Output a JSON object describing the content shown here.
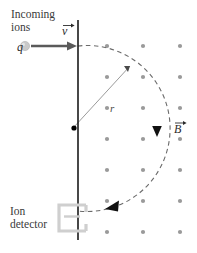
{
  "figure": {
    "background_color": "#ffffff"
  },
  "labels": {
    "incoming_ions": "Incoming\nions",
    "ion_detector": "Ion\ndetector",
    "charge": "q",
    "velocity": "v",
    "magnetic_field": "B",
    "radius": "r"
  },
  "colors": {
    "plate_line": "#1a1a1a",
    "ion_path_dashed": "#6b6b6b",
    "field_dot": "#9a9a9a",
    "detector_outline": "#cfcfcf",
    "velocity_arrow": "#5a5a5a",
    "charge_sphere": "#c8c8c8",
    "radius_line": "#9a9a9a",
    "center_dot": "#000000",
    "arrowhead": "#111111",
    "text": "#3a3a3a"
  },
  "geometry": {
    "plate_line": {
      "x": 78,
      "y_top": 20,
      "y_bottom": 240
    },
    "circle_center": {
      "x": 73,
      "y": 128
    },
    "circle_radius": 83,
    "entry_point": {
      "x": 78,
      "y": 46
    },
    "exit_point": {
      "x": 78,
      "y": 211
    },
    "radius_endpoint": {
      "x": 131,
      "y": 65
    },
    "velocity_arrow": {
      "x_start": 31,
      "x_end": 76,
      "y": 46
    },
    "charge_sphere": {
      "x": 24,
      "y": 46,
      "r": 4.5
    },
    "detector_rect": {
      "x": 58,
      "y": 205,
      "width": 28,
      "height": 26
    }
  },
  "chart_data": {
    "type": "scatter",
    "field_direction": "out-of-page",
    "dot_columns_x": [
      107,
      143,
      180
    ],
    "dot_rows_y": [
      46,
      77,
      108,
      139,
      170,
      201,
      232
    ],
    "dot_radius": 2.1,
    "grid": true,
    "legend": "none"
  },
  "annotations": {
    "arc_arrowheads": [
      {
        "name": "arrowhead-down-right",
        "x": 157,
        "y": 131,
        "rotation_deg": 180
      },
      {
        "name": "arrowhead-left-bottom",
        "x": 114,
        "y": 206,
        "rotation_deg": 255
      },
      {
        "name": "arrowhead-radius-tip",
        "x": 131,
        "y": 65,
        "rotation_deg": 45
      }
    ]
  }
}
